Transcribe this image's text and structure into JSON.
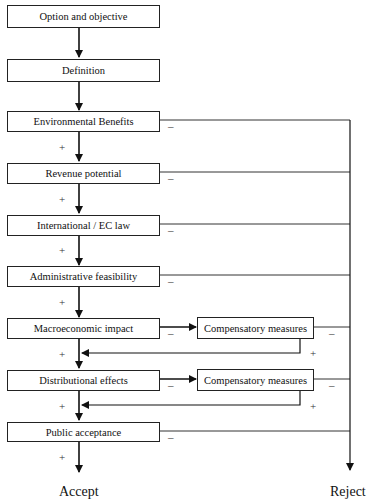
{
  "diagram": {
    "steps": [
      {
        "label": "Option and objective"
      },
      {
        "label": "Definition"
      },
      {
        "label": "Environmental Benefits"
      },
      {
        "label": "Revenue potential"
      },
      {
        "label": "International / EC law"
      },
      {
        "label": "Administrative feasibility"
      },
      {
        "label": "Macroeconomic impact"
      },
      {
        "label": "Distributional effects"
      },
      {
        "label": "Public acceptance"
      }
    ],
    "compensatory": [
      {
        "label": "Compensatory measures"
      },
      {
        "label": "Compensatory measures"
      }
    ],
    "signs": {
      "plus": "+",
      "minus": "–"
    },
    "outcomes": {
      "accept": "Accept",
      "reject": "Reject"
    }
  }
}
